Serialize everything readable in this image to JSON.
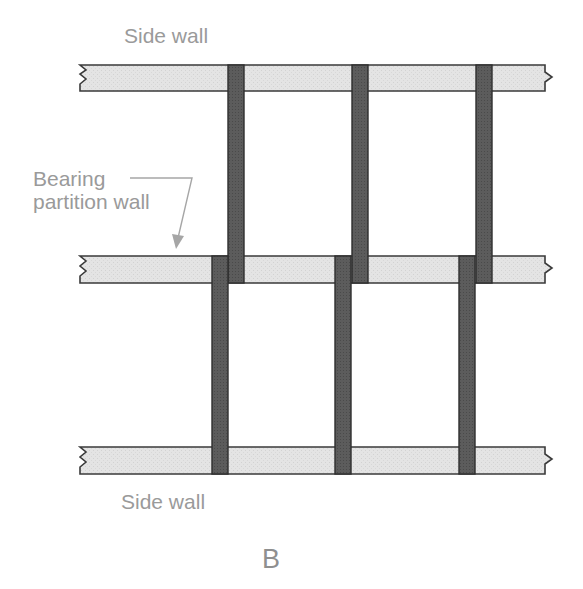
{
  "labels": {
    "top_wall": "Side wall",
    "bearing_line1": "Bearing",
    "bearing_line2": "partition wall",
    "bottom_wall": "Side wall",
    "figure_letter": "B"
  },
  "colors": {
    "wall_fill": "#e4e4e4",
    "wall_stroke": "#3a3a3a",
    "joist_fill": "#5c5c5c",
    "label_text": "#9a9a9a",
    "leader_line": "#a6a6a6"
  },
  "walls": [
    {
      "name": "top-side-wall",
      "x1": 80,
      "x2": 545,
      "y": 65,
      "h": 26
    },
    {
      "name": "bearing-partition-wall",
      "x1": 80,
      "x2": 545,
      "y": 256,
      "h": 27
    },
    {
      "name": "bottom-side-wall",
      "x1": 80,
      "x2": 545,
      "y": 447,
      "h": 27
    }
  ],
  "joists_upper_span": [
    228,
    352,
    476
  ],
  "joists_lower_span": [
    212,
    335,
    459
  ],
  "joist_width": 16
}
